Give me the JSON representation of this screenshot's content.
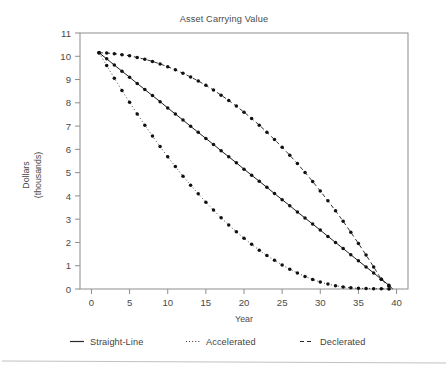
{
  "chart_data": {
    "type": "line",
    "title": "Asset Carrying Value",
    "xlabel": "Year",
    "ylabel": "Dollars\n(thousands)",
    "ylabel_line1": "Dollars",
    "ylabel_line2": "(thousands)",
    "xlim": [
      -1.5,
      41.5
    ],
    "ylim": [
      0,
      11
    ],
    "xticks": [
      0,
      5,
      10,
      15,
      20,
      25,
      30,
      35,
      40
    ],
    "yticks": [
      0,
      1,
      2,
      3,
      4,
      5,
      6,
      7,
      8,
      9,
      10,
      11
    ],
    "grid": false,
    "legend_position": "below-outside",
    "series": [
      {
        "name": "Straight-Line",
        "style": "solid",
        "color": "#111111",
        "x": [
          1,
          2,
          3,
          4,
          5,
          6,
          7,
          8,
          9,
          10,
          11,
          12,
          13,
          14,
          15,
          16,
          17,
          18,
          19,
          20,
          21,
          22,
          23,
          24,
          25,
          26,
          27,
          28,
          29,
          30,
          31,
          32,
          33,
          34,
          35,
          36,
          37,
          38,
          39,
          39.5
        ],
        "values": [
          10.15,
          9.89,
          9.62,
          9.36,
          9.1,
          8.83,
          8.57,
          8.31,
          8.05,
          7.78,
          7.52,
          7.26,
          6.99,
          6.73,
          6.47,
          6.21,
          5.94,
          5.68,
          5.42,
          5.15,
          4.89,
          4.63,
          4.37,
          4.1,
          3.84,
          3.58,
          3.31,
          3.05,
          2.79,
          2.53,
          2.26,
          2.0,
          1.74,
          1.47,
          1.21,
          0.95,
          0.69,
          0.42,
          0.16,
          0.0
        ]
      },
      {
        "name": "Accelerated",
        "style": "dotted",
        "color": "#111111",
        "x": [
          1,
          2,
          3,
          4,
          5,
          6,
          7,
          8,
          9,
          10,
          11,
          12,
          13,
          14,
          15,
          16,
          17,
          18,
          19,
          20,
          21,
          22,
          23,
          24,
          25,
          26,
          27,
          28,
          29,
          30,
          31,
          32,
          33,
          34,
          35,
          36,
          37,
          38,
          39,
          39.5
        ],
        "values": [
          10.15,
          9.6,
          9.06,
          8.53,
          8.02,
          7.52,
          7.04,
          6.57,
          6.12,
          5.68,
          5.26,
          4.85,
          4.46,
          4.09,
          3.73,
          3.39,
          3.06,
          2.75,
          2.46,
          2.18,
          1.92,
          1.67,
          1.44,
          1.23,
          1.03,
          0.85,
          0.69,
          0.54,
          0.41,
          0.3,
          0.21,
          0.14,
          0.09,
          0.05,
          0.03,
          0.02,
          0.01,
          0.01,
          0.0,
          0.0
        ]
      },
      {
        "name": "Declerated",
        "style": "dashed",
        "color": "#111111",
        "x": [
          1,
          2,
          3,
          4,
          5,
          6,
          7,
          8,
          9,
          10,
          11,
          12,
          13,
          14,
          15,
          16,
          17,
          18,
          19,
          20,
          21,
          22,
          23,
          24,
          25,
          26,
          27,
          28,
          29,
          30,
          31,
          32,
          33,
          34,
          35,
          36,
          37,
          38,
          39,
          39.5
        ],
        "values": [
          10.15,
          10.14,
          10.11,
          10.07,
          10.02,
          9.95,
          9.87,
          9.78,
          9.67,
          9.55,
          9.42,
          9.27,
          9.11,
          8.94,
          8.75,
          8.55,
          8.33,
          8.1,
          7.86,
          7.6,
          7.33,
          7.04,
          6.74,
          6.42,
          6.09,
          5.75,
          5.39,
          5.01,
          4.62,
          4.21,
          3.79,
          3.36,
          2.91,
          2.44,
          1.96,
          1.46,
          0.95,
          0.42,
          0.12,
          0.0
        ]
      }
    ],
    "legend": [
      {
        "label": "Straight-Line",
        "style": "solid"
      },
      {
        "label": "Accelerated",
        "style": "dotted"
      },
      {
        "label": "Declerated",
        "style": "dashed"
      }
    ]
  }
}
